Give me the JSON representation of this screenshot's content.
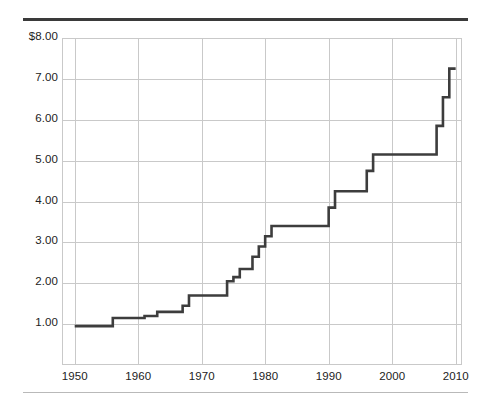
{
  "figure": {
    "top_rule_color": "#3a3a3a",
    "bottom_rule_color": "#b9b9b9",
    "background": "#ffffff"
  },
  "chart_data": {
    "type": "line",
    "subtype": "step",
    "title": "",
    "subtitle": "",
    "xlabel": "",
    "ylabel": "",
    "xlim": [
      1948,
      2011
    ],
    "ylim": [
      0.0,
      8.0
    ],
    "grid": true,
    "legend": false,
    "legend_position": "none",
    "line_color": "#3d3d3d",
    "grid_color": "#c9c9c9",
    "axis_text_color": "#222222",
    "x_ticks": [
      1950,
      1960,
      1970,
      1980,
      1990,
      2000,
      2010
    ],
    "x_tick_labels": [
      "1950",
      "1960",
      "1970",
      "1980",
      "1990",
      "2000",
      "2010"
    ],
    "y_ticks": [
      1.0,
      2.0,
      3.0,
      4.0,
      5.0,
      6.0,
      7.0,
      8.0
    ],
    "y_tick_labels": [
      "1.00",
      "2.00",
      "3.00",
      "4.00",
      "5.00",
      "6.00",
      "7.00",
      "$8.00"
    ],
    "series": [
      {
        "name": "Minimum wage",
        "x": [
          1950,
          1956,
          1961,
          1963,
          1967,
          1968,
          1974,
          1975,
          1976,
          1978,
          1979,
          1980,
          1981,
          1990,
          1991,
          1996,
          1997,
          2007,
          2008,
          2009,
          2010
        ],
        "values": [
          0.95,
          1.15,
          1.2,
          1.3,
          1.45,
          1.7,
          2.05,
          2.15,
          2.35,
          2.65,
          2.9,
          3.15,
          3.4,
          3.85,
          4.25,
          4.75,
          5.15,
          5.85,
          6.55,
          7.25,
          7.25
        ]
      }
    ],
    "points": [
      {
        "year": 1950,
        "value": 0.95
      },
      {
        "year": 1956,
        "value": 1.15
      },
      {
        "year": 1961,
        "value": 1.2
      },
      {
        "year": 1963,
        "value": 1.3
      },
      {
        "year": 1967,
        "value": 1.45
      },
      {
        "year": 1968,
        "value": 1.7
      },
      {
        "year": 1974,
        "value": 2.05
      },
      {
        "year": 1975,
        "value": 2.15
      },
      {
        "year": 1976,
        "value": 2.35
      },
      {
        "year": 1978,
        "value": 2.65
      },
      {
        "year": 1979,
        "value": 2.9
      },
      {
        "year": 1980,
        "value": 3.15
      },
      {
        "year": 1981,
        "value": 3.4
      },
      {
        "year": 1990,
        "value": 3.85
      },
      {
        "year": 1991,
        "value": 4.25
      },
      {
        "year": 1996,
        "value": 4.75
      },
      {
        "year": 1997,
        "value": 5.15
      },
      {
        "year": 2007,
        "value": 5.85
      },
      {
        "year": 2008,
        "value": 6.55
      },
      {
        "year": 2009,
        "value": 7.25
      },
      {
        "year": 2010,
        "value": 7.25
      }
    ]
  }
}
